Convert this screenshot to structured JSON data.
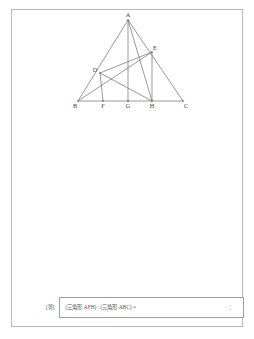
{
  "document": {
    "type": "math-worksheet-page"
  },
  "figure": {
    "name": "triangle-geometry-figure",
    "vertices": [
      {
        "label": "A",
        "x": 68,
        "y": 8,
        "lx": 68,
        "ly": 4.5,
        "anchor": "middle"
      },
      {
        "label": "B",
        "x": 18,
        "y": 89,
        "lx": 15,
        "ly": 96,
        "anchor": "middle"
      },
      {
        "label": "C",
        "x": 123,
        "y": 89,
        "lx": 126,
        "ly": 96,
        "anchor": "middle"
      },
      {
        "label": "D",
        "x": 40,
        "y": 61,
        "lx": 35,
        "ly": 60,
        "anchor": "middle"
      },
      {
        "label": "E",
        "x": 92,
        "y": 40,
        "lx": 95,
        "ly": 38,
        "anchor": "middle"
      },
      {
        "label": "F",
        "x": 43,
        "y": 89,
        "lx": 43,
        "ly": 96,
        "anchor": "middle"
      },
      {
        "label": "G",
        "x": 68,
        "y": 89,
        "lx": 68,
        "ly": 96,
        "anchor": "middle"
      },
      {
        "label": "H",
        "x": 92,
        "y": 89,
        "lx": 92,
        "ly": 96,
        "anchor": "middle"
      }
    ],
    "segments": [
      {
        "name": "side-AB",
        "x1": 68,
        "y1": 8,
        "x2": 18,
        "y2": 89
      },
      {
        "name": "side-AC",
        "x1": 68,
        "y1": 8,
        "x2": 123,
        "y2": 89
      },
      {
        "name": "side-BC",
        "x1": 18,
        "y1": 89,
        "x2": 123,
        "y2": 89
      },
      {
        "name": "cevian-AG",
        "x1": 68,
        "y1": 8,
        "x2": 68,
        "y2": 89
      },
      {
        "name": "cevian-AH",
        "x1": 68,
        "y1": 8,
        "x2": 92,
        "y2": 89
      },
      {
        "name": "line-BE",
        "x1": 18,
        "y1": 89,
        "x2": 92,
        "y2": 40
      },
      {
        "name": "segment-DE",
        "x1": 40,
        "y1": 61,
        "x2": 92,
        "y2": 40
      },
      {
        "name": "perpendicular-DF",
        "x1": 40,
        "y1": 61,
        "x2": 43,
        "y2": 89
      },
      {
        "name": "segment-DH",
        "x1": 40,
        "y1": 61,
        "x2": 92,
        "y2": 89
      },
      {
        "name": "perpendicular-EH",
        "x1": 92,
        "y1": 40,
        "x2": 92,
        "y2": 89
      }
    ]
  },
  "answer": {
    "tag": "[答]",
    "expression": "(三角形 AFH) : (三角形 ABC) =",
    "blank": "：",
    "value": ""
  }
}
